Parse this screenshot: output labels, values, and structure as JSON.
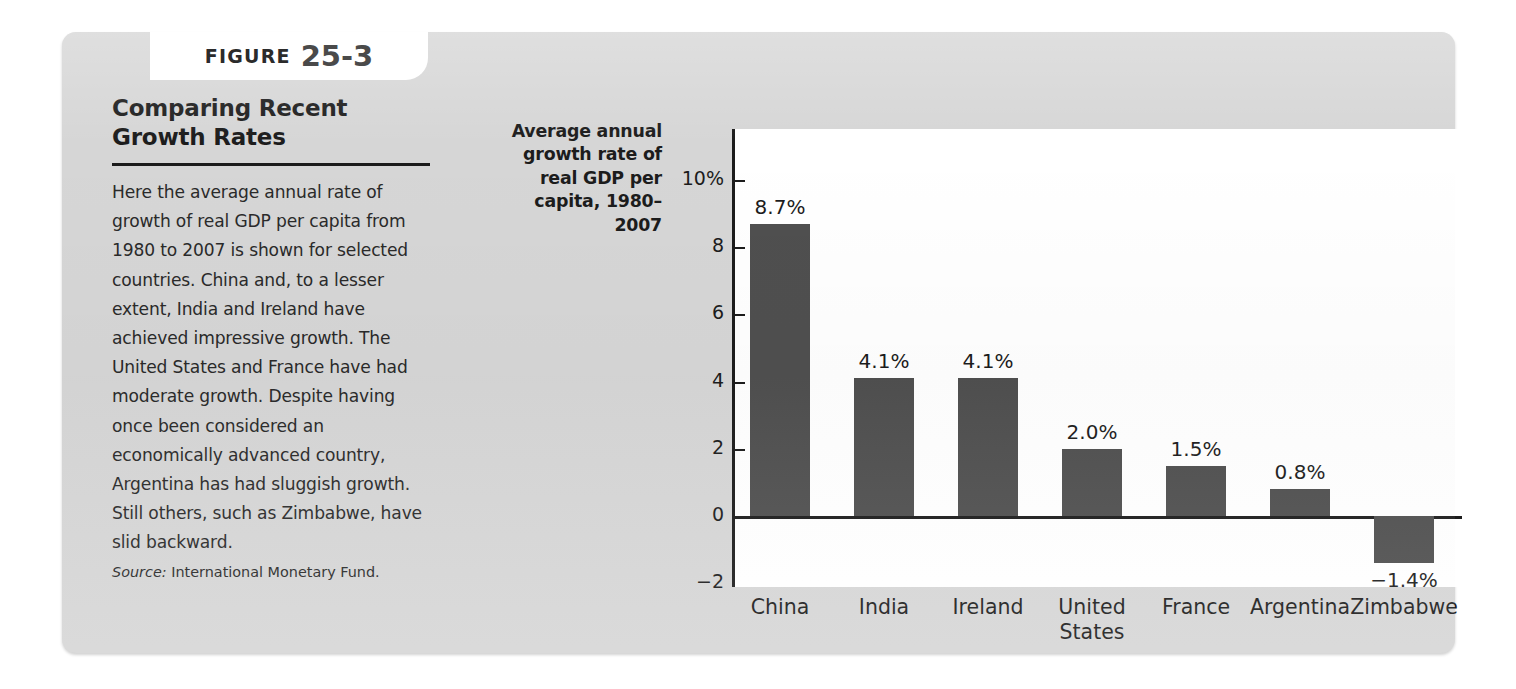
{
  "figure": {
    "tab_word": "FIGURE",
    "tab_number": "25-3",
    "title": "Comparing Recent Growth Rates",
    "body": "Here the average annual rate of growth of real GDP per capita from 1980 to 2007 is shown for selected countries. China and, to a lesser extent, India and Ireland have achieved impressive growth. The United States and France have had moderate growth. Despite having once been considered an economically advanced country, Argentina has had sluggish growth. Still others, such as Zimbabwe, have slid backward.",
    "source_label": "Source:",
    "source_text": "International Monetary Fund."
  },
  "colors": {
    "panel": "#d6d6d6",
    "bar": "#4f4f4f",
    "axis": "#1c1c1c",
    "plot_background": "#ffffff"
  },
  "chart_data": {
    "type": "bar",
    "title": "Comparing Recent Growth Rates",
    "ylabel": "Average annual growth rate of real GDP per capita, 1980–2007",
    "xlabel": "",
    "categories": [
      "China",
      "India",
      "Ireland",
      "United States",
      "France",
      "Argentina",
      "Zimbabwe"
    ],
    "category_labels": [
      "China",
      "India",
      "Ireland",
      "United\nStates",
      "France",
      "Argentina",
      "Zimbabwe"
    ],
    "values": [
      8.7,
      4.1,
      4.1,
      2.0,
      1.5,
      0.8,
      -1.4
    ],
    "value_labels": [
      "8.7%",
      "4.1%",
      "4.1%",
      "2.0%",
      "1.5%",
      "0.8%",
      "−1.4%"
    ],
    "ylim": [
      -2,
      10
    ],
    "yticks": [
      10,
      8,
      6,
      4,
      2,
      0,
      -2
    ],
    "ytick_labels": [
      "10%",
      "8",
      "6",
      "4",
      "2",
      "0",
      "−2"
    ],
    "grid": false,
    "legend": false,
    "bar_color": "#4f4f4f"
  }
}
